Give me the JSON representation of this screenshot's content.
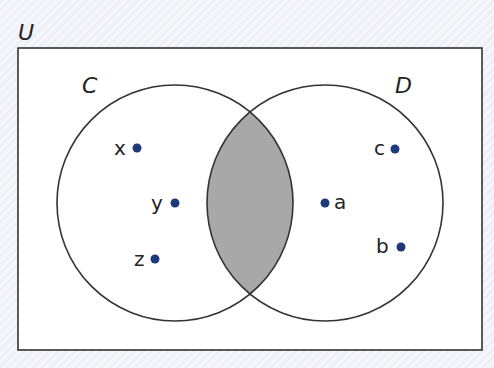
{
  "diagram": {
    "type": "venn",
    "universe_label": "U",
    "sets": [
      {
        "label": "C",
        "elements_only": [
          "x",
          "y",
          "z"
        ]
      },
      {
        "label": "D",
        "elements_only": [
          "c",
          "a",
          "b"
        ]
      }
    ],
    "intersection": {
      "elements": [],
      "shaded": true
    },
    "shaded_region": "C ∩ D",
    "points": [
      {
        "label": "x",
        "set": "C"
      },
      {
        "label": "y",
        "set": "C"
      },
      {
        "label": "z",
        "set": "C"
      },
      {
        "label": "c",
        "set": "D"
      },
      {
        "label": "a",
        "set": "D"
      },
      {
        "label": "b",
        "set": "D"
      }
    ],
    "colors": {
      "shade": "#a8a8a8",
      "dot": "#1f3a7a",
      "line": "#333333"
    }
  }
}
